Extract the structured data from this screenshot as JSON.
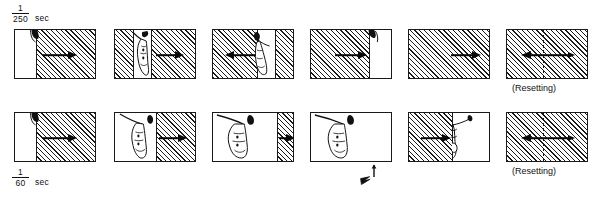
{
  "figure": {
    "rows": [
      {
        "id": "row-250",
        "speed_label": {
          "numerator": "1",
          "denominator": "250",
          "unit": "sec"
        },
        "frames": [
          {
            "id": "t1",
            "exposed_fraction": 0.25,
            "slit": "opening",
            "arrow": "right",
            "caption": ""
          },
          {
            "id": "t2",
            "exposed_fraction": 0.3,
            "slit": "narrow-slit",
            "arrow": "right",
            "caption": ""
          },
          {
            "id": "t3",
            "exposed_fraction": 0.55,
            "slit": "narrow-slit",
            "arrow": "left",
            "caption": ""
          },
          {
            "id": "t4",
            "exposed_fraction": 0.75,
            "slit": "closing",
            "arrow": "right",
            "caption": ""
          },
          {
            "id": "t5",
            "exposed_fraction": 1.0,
            "slit": "closed",
            "arrow": "right",
            "caption": ""
          },
          {
            "id": "t6",
            "exposed_fraction": 1.0,
            "slit": "closed",
            "arrow": "both",
            "caption": "(Resetting)"
          }
        ]
      },
      {
        "id": "row-60",
        "speed_label": {
          "numerator": "1",
          "denominator": "60",
          "unit": "sec"
        },
        "frames": [
          {
            "id": "b1",
            "exposed_fraction": 0.25,
            "slit": "opening",
            "arrow": "right",
            "caption": ""
          },
          {
            "id": "b2",
            "exposed_fraction": 0.5,
            "slit": "wide-open",
            "arrow": "right",
            "caption": ""
          },
          {
            "id": "b3",
            "exposed_fraction": 0.78,
            "slit": "wide-open",
            "arrow": "right",
            "caption": ""
          },
          {
            "id": "b4",
            "exposed_fraction": 1.0,
            "slit": "fully-open",
            "arrow": "none",
            "caption": ""
          },
          {
            "id": "b5",
            "exposed_fraction": 0.52,
            "slit": "closing",
            "arrow": "right",
            "caption": ""
          },
          {
            "id": "b6",
            "exposed_fraction": 1.0,
            "slit": "closed",
            "arrow": "both",
            "caption": "(Resetting)"
          }
        ]
      }
    ],
    "flash_sync_mark": {
      "symbol": "lightning-bolt",
      "label": ""
    }
  }
}
